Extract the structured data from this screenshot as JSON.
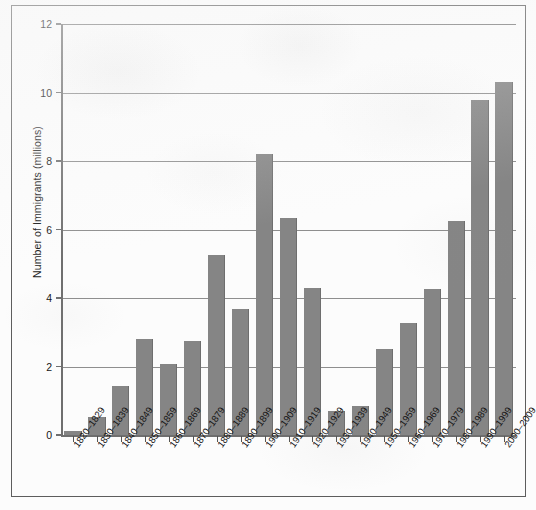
{
  "chart_data": {
    "type": "bar",
    "title": "",
    "xlabel": "",
    "ylabel": "Number of Immigrants (millions)",
    "ylim": [
      0,
      12
    ],
    "ytick_labels": [
      "0",
      "2",
      "4",
      "6",
      "8",
      "10",
      "12"
    ],
    "yticks": [
      0,
      2,
      4,
      6,
      8,
      10,
      12
    ],
    "grid": true,
    "legend": "none",
    "bar_color": "#858585",
    "categories": [
      "1820–1829",
      "1830–1839",
      "1840–1849",
      "1850–1859",
      "1860–1869",
      "1870–1879",
      "1880–1889",
      "1890–1899",
      "1900–1909",
      "1910–1919",
      "1920–1929",
      "1930–1939",
      "1940–1949",
      "1950–1959",
      "1960–1969",
      "1970–1979",
      "1980–1989",
      "1990–1999",
      "2000–2009"
    ],
    "values": [
      0.13,
      0.54,
      1.43,
      2.81,
      2.08,
      2.74,
      5.25,
      3.69,
      8.2,
      6.35,
      4.3,
      0.7,
      0.86,
      2.5,
      3.26,
      4.25,
      6.24,
      9.78,
      10.3
    ]
  }
}
